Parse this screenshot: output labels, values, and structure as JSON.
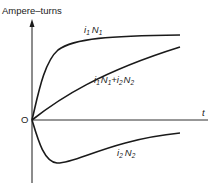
{
  "diagram": {
    "y_axis_label": "Ampere–turns",
    "x_axis_label": "t",
    "origin_label": "O",
    "colors": {
      "line": "#1a1a1a",
      "text": "#222222",
      "background": "#ffffff"
    },
    "curves": [
      {
        "id": "i1N1",
        "label_main": "i",
        "label_sub1": "1",
        "label_mid": "N",
        "label_sub2": "1",
        "description": "primary ampere-turns, rises quickly and saturates"
      },
      {
        "id": "i1N1_plus_i2N2",
        "label": "i1N1+i2N2",
        "description": "net ampere-turns, rises gradually"
      },
      {
        "id": "i2N2",
        "label_main": "i",
        "label_sub1": "2",
        "label_mid": "N",
        "label_sub2": "2",
        "description": "secondary ampere-turns, dips negative then decays toward zero"
      }
    ],
    "sum_label": {
      "p1": "i",
      "s1": "1",
      "p2": "N",
      "s2": "1",
      "plus": "+",
      "p3": "i",
      "s3": "2",
      "p4": "N",
      "s4": "2"
    }
  }
}
